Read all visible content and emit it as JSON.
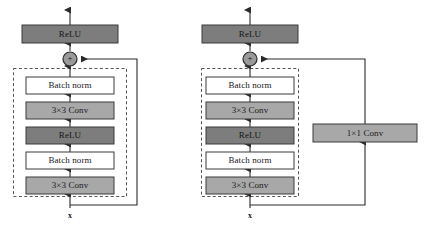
{
  "figure": {
    "title": "",
    "background_color": "#ffffff",
    "colors": {
      "conv_fill": "#a8a8a8",
      "relu_fill": "#7d7d7d",
      "batchnorm_fill": "#ffffff",
      "box_stroke": "#3a3a3a",
      "line": "#2b2b2b",
      "dashed_border": "#555555",
      "adder_fill": "#9a9a9a",
      "text": "#1a1a1a"
    },
    "input_label": "x",
    "adder_symbol": "+"
  },
  "panels": [
    {
      "id": "basic-residual-block",
      "name": "residual-block-identity-shortcut",
      "has_projection_shortcut": false,
      "shortcut_label": "",
      "output_relu": {
        "label": "ReLU",
        "style": "relu"
      },
      "adder": {
        "label": "+"
      },
      "input_label": "x",
      "blocks": [
        {
          "label": "Batch norm",
          "style": "batchnorm"
        },
        {
          "label": "3×3 Conv",
          "style": "conv"
        },
        {
          "label": "ReLU",
          "style": "relu"
        },
        {
          "label": "Batch norm",
          "style": "batchnorm"
        },
        {
          "label": "3×3 Conv",
          "style": "conv"
        }
      ]
    },
    {
      "id": "projection-residual-block",
      "name": "residual-block-projection-shortcut",
      "has_projection_shortcut": true,
      "shortcut_label": "1×1 Conv",
      "shortcut_style": "conv",
      "output_relu": {
        "label": "ReLU",
        "style": "relu"
      },
      "adder": {
        "label": "+"
      },
      "input_label": "x",
      "blocks": [
        {
          "label": "Batch norm",
          "style": "batchnorm"
        },
        {
          "label": "3×3 Conv",
          "style": "conv"
        },
        {
          "label": "ReLU",
          "style": "relu"
        },
        {
          "label": "Batch norm",
          "style": "batchnorm"
        },
        {
          "label": "3×3 Conv",
          "style": "conv"
        }
      ]
    }
  ]
}
